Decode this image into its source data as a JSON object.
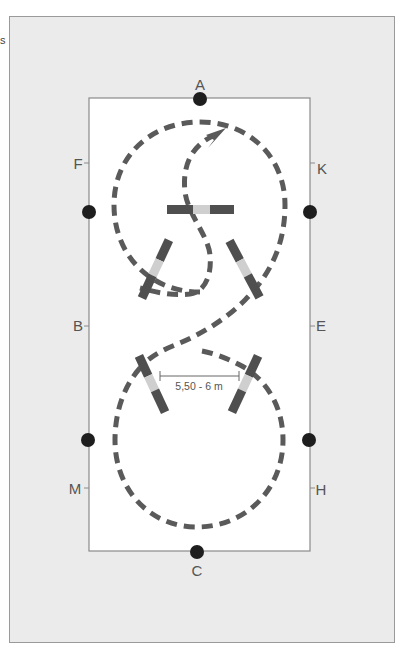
{
  "corner_glyph": "s",
  "arena": {
    "letters": {
      "A": "A",
      "C": "C",
      "F": "F",
      "B": "B",
      "M": "M",
      "K": "K",
      "E": "E",
      "H": "H"
    },
    "markers": [
      "top-center",
      "bottom-center",
      "left-upper",
      "left-lower",
      "right-upper",
      "right-lower"
    ]
  },
  "measurement": {
    "label": "5,50 - 6 m"
  },
  "poles": [
    {
      "name": "center-top-pole",
      "orientation": "horizontal"
    },
    {
      "name": "upper-left-pole",
      "orientation": "diagonal"
    },
    {
      "name": "upper-right-pole",
      "orientation": "diagonal"
    },
    {
      "name": "lower-left-pole",
      "orientation": "diagonal"
    },
    {
      "name": "lower-right-pole",
      "orientation": "diagonal"
    }
  ],
  "colors": {
    "frame_bg": "#ebebeb",
    "arena_bg": "#ffffff",
    "arena_border": "#8a8a8a",
    "path": "#5a5a5a",
    "pole_dark": "#4f4f4f",
    "pole_light": "#cfcfcf",
    "marker": "#1e1e1e",
    "text": "#555555"
  }
}
